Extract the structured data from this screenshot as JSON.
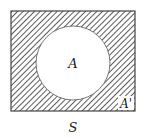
{
  "diagram": {
    "type": "venn",
    "universe_label": "S",
    "set_label": "A",
    "complement_label": "A'",
    "shaded_region": "complement of A",
    "colors": {
      "hatch": "#333333",
      "outline": "#444444",
      "background": "#ffffff"
    }
  }
}
